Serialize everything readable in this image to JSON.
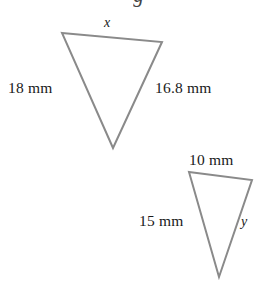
{
  "canvas": {
    "width": 277,
    "height": 284,
    "background": "#ffffff"
  },
  "cropped_title": {
    "text": "g",
    "note": "partially cut-off descender at very top edge"
  },
  "style": {
    "stroke_color": "#8a8a8a",
    "stroke_width": 2,
    "text_color": "#1a1a1a"
  },
  "figure": {
    "caption": "Two similar inverted triangles with labeled side lengths",
    "units": "mm"
  },
  "shapes": [
    {
      "name": "triangle-large",
      "orientation": "inverted",
      "points": "62,33 162,42 113,148",
      "vertices": [
        {
          "x": 62,
          "y": 33
        },
        {
          "x": 162,
          "y": 42
        },
        {
          "x": 113,
          "y": 148
        }
      ]
    },
    {
      "name": "triangle-small",
      "orientation": "inverted",
      "points": "189,172 252,180 219,277",
      "vertices": [
        {
          "x": 189,
          "y": 172
        },
        {
          "x": 252,
          "y": 180
        },
        {
          "x": 219,
          "y": 277
        }
      ]
    }
  ],
  "labels": {
    "large": {
      "top": {
        "text": "x",
        "kind": "variable",
        "x": 104,
        "y": 16
      },
      "left": {
        "text": "18 mm",
        "kind": "measure",
        "x": 8,
        "y": 80
      },
      "right": {
        "text": "16.8 mm",
        "kind": "measure",
        "x": 155,
        "y": 80
      }
    },
    "small": {
      "top": {
        "text": "10 mm",
        "kind": "measure",
        "x": 189,
        "y": 152
      },
      "left": {
        "text": "15 mm",
        "kind": "measure",
        "x": 139,
        "y": 213
      },
      "right": {
        "text": "y",
        "kind": "variable",
        "x": 241,
        "y": 215
      }
    }
  }
}
